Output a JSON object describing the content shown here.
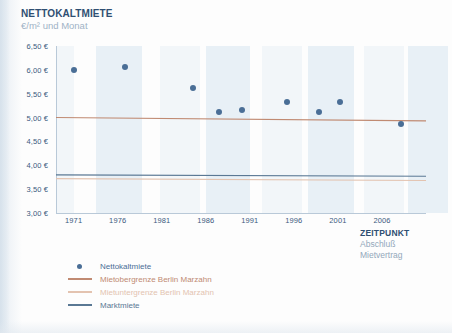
{
  "header": {
    "title": "NETTOKALTMIETE",
    "subtitle": "€/m² und Monat"
  },
  "xaxis_title": {
    "title": "ZEITPUNKT",
    "line1": "Abschluß",
    "line2": "Mietvertrag"
  },
  "legend": {
    "items": [
      {
        "label": "Nettokaltmiete",
        "marker": "dot",
        "color": "#4a6e96"
      },
      {
        "label": "Mietobergrenze Berlin Marzahn",
        "marker": "line",
        "color": "#c08a72"
      },
      {
        "label": "Mietuntergrenze Berlin Marzahn",
        "marker": "line",
        "color": "#e3c3b0"
      },
      {
        "label": "Marktmiete",
        "marker": "line",
        "color": "#5a7894"
      }
    ]
  },
  "colors": {
    "title": "#2f4f72",
    "subtitle": "#9fb3c6",
    "dot": "#4a6e96",
    "upper_limit": "#c08a72",
    "lower_limit": "#e3c3b0",
    "market": "#5a7894",
    "axis": "#b9c9d8",
    "band": "#e9f0f6"
  },
  "chart_data": {
    "type": "scatter",
    "title": "NETTOKALTMIETE",
    "subtitle": "€/m² und Monat",
    "xlabel": "ZEITPUNKT Abschluß Mietvertrag",
    "ylabel": "€/m² und Monat",
    "xlim": [
      1969,
      2011
    ],
    "ylim": [
      3.0,
      6.5
    ],
    "grid": false,
    "legend_position": "bottom-left",
    "xticks": [
      1971,
      1976,
      1981,
      1986,
      1991,
      1996,
      2001,
      2006
    ],
    "xticklabels": [
      "1971",
      "1976",
      "1981",
      "1986",
      "1991",
      "1996",
      "2001",
      "2006"
    ],
    "yticks": [
      6.5,
      6.0,
      5.5,
      5.0,
      4.5,
      4.0,
      3.5,
      3.0
    ],
    "yticklabels": [
      "6,50 €",
      "6,00 €",
      "5,50 €",
      "5,00 €",
      "4,50 €",
      "4,00 €",
      "3,50 €",
      "3,00 €"
    ],
    "series": [
      {
        "name": "Nettokaltmiete",
        "type": "scatter",
        "color": "#4a6e96",
        "points": [
          {
            "x": 1971.0,
            "y": 6.0
          },
          {
            "x": 1976.8,
            "y": 6.05
          },
          {
            "x": 1984.6,
            "y": 5.62
          },
          {
            "x": 1987.5,
            "y": 5.11
          },
          {
            "x": 1990.1,
            "y": 5.15
          },
          {
            "x": 1995.2,
            "y": 5.33
          },
          {
            "x": 1998.8,
            "y": 5.12
          },
          {
            "x": 2001.2,
            "y": 5.32
          },
          {
            "x": 2008.2,
            "y": 4.87
          }
        ]
      },
      {
        "name": "Mietobergrenze Berlin Marzahn",
        "type": "line",
        "color": "#c08a72",
        "points": [
          {
            "x": 1969.0,
            "y": 5.0
          },
          {
            "x": 2011.0,
            "y": 4.93
          }
        ]
      },
      {
        "name": "Mietuntergrenze Berlin Marzahn",
        "type": "line",
        "color": "#e3c3b0",
        "points": [
          {
            "x": 1969.0,
            "y": 3.72
          },
          {
            "x": 2011.0,
            "y": 3.68
          }
        ]
      },
      {
        "name": "Marktmiete",
        "type": "line",
        "color": "#5a7894",
        "points": [
          {
            "x": 1969.0,
            "y": 3.8
          },
          {
            "x": 2011.0,
            "y": 3.77
          }
        ]
      }
    ]
  }
}
